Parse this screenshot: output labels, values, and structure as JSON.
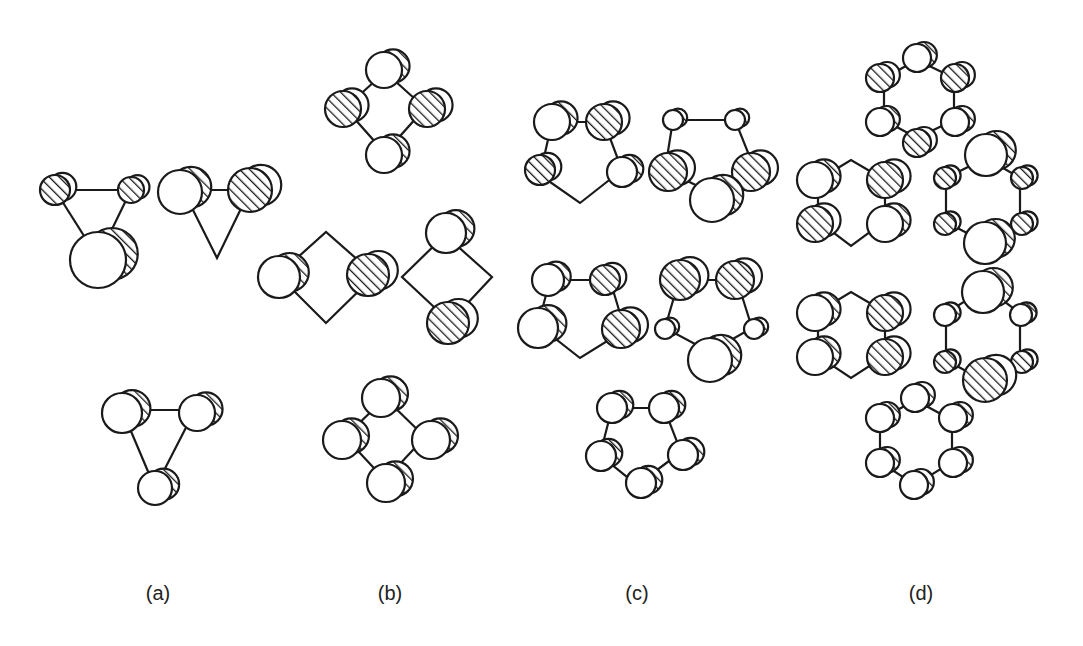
{
  "figure": {
    "colors": {
      "stroke": "#1a1a1a",
      "fill": "#ffffff",
      "hatch": "#1a1a1a"
    },
    "back_offset": [
      9,
      -4
    ],
    "labels": [
      {
        "text": "(a)",
        "x": 158
      },
      {
        "text": "(b)",
        "x": 390
      },
      {
        "text": "(c)",
        "x": 637
      },
      {
        "text": "(d)",
        "x": 921
      }
    ],
    "groups": [
      {
        "id": "a",
        "molecules": [
          {
            "bonds": [
              [
                55,
                190,
                131,
                190
              ],
              [
                55,
                190,
                98,
                258
              ],
              [
                131,
                190,
                98,
                258
              ]
            ],
            "atoms": [
              {
                "x": 55,
                "y": 190,
                "r": 15,
                "h": true
              },
              {
                "x": 131,
                "y": 190,
                "r": 13,
                "h": true
              },
              {
                "x": 98,
                "y": 260,
                "r": 28,
                "h": false
              }
            ]
          },
          {
            "bonds": [
              [
                183,
                190,
                250,
                190
              ],
              [
                183,
                190,
                217,
                258,
                250,
                190
              ]
            ],
            "atoms": [
              {
                "x": 180,
                "y": 192,
                "r": 22,
                "h": false
              },
              {
                "x": 250,
                "y": 190,
                "r": 22,
                "h": true
              }
            ]
          },
          {
            "bonds": [
              [
                122,
                410,
                195,
                410
              ],
              [
                122,
                410,
                155,
                488
              ],
              [
                195,
                410,
                155,
                488
              ]
            ],
            "atoms": [
              {
                "x": 122,
                "y": 413,
                "r": 20,
                "h": false
              },
              {
                "x": 197,
                "y": 413,
                "r": 18,
                "h": false
              },
              {
                "x": 155,
                "y": 488,
                "r": 17,
                "h": false
              }
            ]
          }
        ]
      },
      {
        "id": "b",
        "molecules": [
          {
            "bonds": [
              [
                385,
                72,
                345,
                108,
                385,
                153,
                425,
                108,
                385,
                72
              ]
            ],
            "atoms": [
              {
                "x": 384,
                "y": 70,
                "r": 18,
                "h": false
              },
              {
                "x": 343,
                "y": 109,
                "r": 18,
                "h": true
              },
              {
                "x": 427,
                "y": 109,
                "r": 18,
                "h": true
              },
              {
                "x": 384,
                "y": 155,
                "r": 18,
                "h": false
              }
            ]
          },
          {
            "bonds": [
              [
                278,
                275,
                326,
                232,
                375,
                275,
                326,
                323,
                278,
                275
              ]
            ],
            "atoms": [
              {
                "x": 279,
                "y": 277,
                "r": 21,
                "h": false
              },
              {
                "x": 368,
                "y": 275,
                "r": 21,
                "h": true
              }
            ]
          },
          {
            "bonds": [
              [
                445,
                235,
                402,
                277,
                450,
                322,
                492,
                277,
                445,
                235
              ]
            ],
            "atoms": [
              {
                "x": 446,
                "y": 233,
                "r": 20,
                "h": false
              },
              {
                "x": 448,
                "y": 323,
                "r": 21,
                "h": true
              }
            ]
          },
          {
            "bonds": [
              [
                385,
                398,
                345,
                437,
                385,
                480,
                425,
                437,
                385,
                398
              ]
            ],
            "atoms": [
              {
                "x": 381,
                "y": 398,
                "r": 19,
                "h": false
              },
              {
                "x": 342,
                "y": 440,
                "r": 19,
                "h": false
              },
              {
                "x": 431,
                "y": 440,
                "r": 19,
                "h": false
              },
              {
                "x": 386,
                "y": 483,
                "r": 19,
                "h": false
              }
            ]
          }
        ]
      },
      {
        "id": "c",
        "molecules": [
          {
            "bonds": [
              [
                552,
                122,
                604,
                122,
                622,
                170,
                580,
                203,
                540,
                175,
                552,
                122
              ]
            ],
            "atoms": [
              {
                "x": 552,
                "y": 122,
                "r": 18,
                "h": false
              },
              {
                "x": 604,
                "y": 122,
                "r": 18,
                "h": true
              },
              {
                "x": 622,
                "y": 172,
                "r": 15,
                "h": false
              },
              {
                "x": 540,
                "y": 170,
                "r": 15,
                "h": true
              }
            ]
          },
          {
            "bonds": [
              [
                673,
                120,
                735,
                120,
                755,
                170,
                712,
                193,
                665,
                170,
                673,
                120
              ]
            ],
            "atoms": [
              {
                "x": 673,
                "y": 120,
                "r": 10,
                "h": false
              },
              {
                "x": 735,
                "y": 120,
                "r": 10,
                "h": false
              },
              {
                "x": 751,
                "y": 172,
                "r": 19,
                "h": true
              },
              {
                "x": 668,
                "y": 172,
                "r": 19,
                "h": true
              },
              {
                "x": 712,
                "y": 200,
                "r": 22,
                "h": false
              }
            ]
          },
          {
            "bonds": [
              [
                550,
                280,
                610,
                280,
                625,
                330,
                580,
                358,
                538,
                325,
                550,
                280
              ]
            ],
            "atoms": [
              {
                "x": 548,
                "y": 280,
                "r": 16,
                "h": false
              },
              {
                "x": 605,
                "y": 280,
                "r": 15,
                "h": true
              },
              {
                "x": 621,
                "y": 329,
                "r": 19,
                "h": true
              },
              {
                "x": 538,
                "y": 328,
                "r": 20,
                "h": false
              }
            ]
          },
          {
            "bonds": [
              [
                679,
                280,
                737,
                280,
                752,
                328,
                710,
                352,
                665,
                328,
                679,
                280
              ]
            ],
            "atoms": [
              {
                "x": 680,
                "y": 280,
                "r": 20,
                "h": true
              },
              {
                "x": 735,
                "y": 280,
                "r": 19,
                "h": true
              },
              {
                "x": 754,
                "y": 329,
                "r": 10,
                "h": false
              },
              {
                "x": 665,
                "y": 329,
                "r": 10,
                "h": false
              },
              {
                "x": 710,
                "y": 360,
                "r": 22,
                "h": false
              }
            ]
          },
          {
            "bonds": [
              [
                612,
                408,
                664,
                408,
                681,
                452,
                637,
                485,
                600,
                455,
                612,
                408
              ]
            ],
            "atoms": [
              {
                "x": 612,
                "y": 408,
                "r": 15,
                "h": false
              },
              {
                "x": 664,
                "y": 408,
                "r": 15,
                "h": false
              },
              {
                "x": 683,
                "y": 455,
                "r": 15,
                "h": false
              },
              {
                "x": 601,
                "y": 456,
                "r": 15,
                "h": false
              },
              {
                "x": 641,
                "y": 483,
                "r": 15,
                "h": false
              }
            ]
          }
        ]
      },
      {
        "id": "d",
        "molecules": [
          {
            "bonds": [
              [
                917,
                60,
                884,
                78,
                884,
                120,
                917,
                138,
                954,
                120,
                954,
                78,
                917,
                60
              ]
            ],
            "atoms": [
              {
                "x": 917,
                "y": 58,
                "r": 14,
                "h": false
              },
              {
                "x": 880,
                "y": 78,
                "r": 14,
                "h": true
              },
              {
                "x": 955,
                "y": 78,
                "r": 14,
                "h": true
              },
              {
                "x": 880,
                "y": 122,
                "r": 14,
                "h": false
              },
              {
                "x": 955,
                "y": 122,
                "r": 14,
                "h": false
              },
              {
                "x": 917,
                "y": 143,
                "r": 14,
                "h": true
              }
            ]
          },
          {
            "bonds": [
              [
                818,
                180,
                851,
                160,
                885,
                180,
                885,
                221,
                851,
                246,
                818,
                221,
                818,
                180
              ]
            ],
            "atoms": [
              {
                "x": 815,
                "y": 180,
                "r": 18,
                "h": false
              },
              {
                "x": 885,
                "y": 180,
                "r": 18,
                "h": true
              },
              {
                "x": 815,
                "y": 224,
                "r": 18,
                "h": true
              },
              {
                "x": 885,
                "y": 224,
                "r": 18,
                "h": false
              }
            ]
          },
          {
            "bonds": [
              [
                986,
                158,
                946,
                178,
                946,
                222,
                986,
                243,
                1020,
                222,
                1020,
                178,
                986,
                158
              ]
            ],
            "atoms": [
              {
                "x": 986,
                "y": 155,
                "r": 21,
                "h": false
              },
              {
                "x": 945,
                "y": 178,
                "r": 11,
                "h": true
              },
              {
                "x": 1022,
                "y": 178,
                "r": 11,
                "h": true
              },
              {
                "x": 945,
                "y": 224,
                "r": 11,
                "h": true
              },
              {
                "x": 1022,
                "y": 224,
                "r": 11,
                "h": true
              },
              {
                "x": 985,
                "y": 243,
                "r": 21,
                "h": false
              }
            ]
          },
          {
            "bonds": [
              [
                818,
                312,
                851,
                292,
                885,
                312,
                885,
                356,
                851,
                378,
                818,
                356,
                818,
                312
              ]
            ],
            "atoms": [
              {
                "x": 815,
                "y": 313,
                "r": 18,
                "h": false
              },
              {
                "x": 885,
                "y": 313,
                "r": 18,
                "h": true
              },
              {
                "x": 815,
                "y": 357,
                "r": 18,
                "h": false
              },
              {
                "x": 885,
                "y": 357,
                "r": 18,
                "h": true
              }
            ]
          },
          {
            "bonds": [
              [
                986,
                288,
                946,
                313,
                946,
                360,
                986,
                382,
                1020,
                360,
                1020,
                313,
                986,
                288
              ]
            ],
            "atoms": [
              {
                "x": 983,
                "y": 292,
                "r": 21,
                "h": false
              },
              {
                "x": 945,
                "y": 315,
                "r": 11,
                "h": false
              },
              {
                "x": 1021,
                "y": 315,
                "r": 11,
                "h": false
              },
              {
                "x": 945,
                "y": 362,
                "r": 11,
                "h": true
              },
              {
                "x": 1022,
                "y": 362,
                "r": 11,
                "h": true
              },
              {
                "x": 985,
                "y": 380,
                "r": 22,
                "h": true
              }
            ]
          },
          {
            "bonds": [
              [
                915,
                400,
                880,
                420,
                880,
                462,
                915,
                485,
                952,
                462,
                952,
                420,
                915,
                400
              ]
            ],
            "atoms": [
              {
                "x": 915,
                "y": 398,
                "r": 14,
                "h": false
              },
              {
                "x": 880,
                "y": 418,
                "r": 14,
                "h": false
              },
              {
                "x": 953,
                "y": 418,
                "r": 14,
                "h": false
              },
              {
                "x": 880,
                "y": 463,
                "r": 14,
                "h": false
              },
              {
                "x": 953,
                "y": 463,
                "r": 14,
                "h": false
              },
              {
                "x": 914,
                "y": 485,
                "r": 14,
                "h": false
              }
            ]
          }
        ]
      }
    ]
  }
}
